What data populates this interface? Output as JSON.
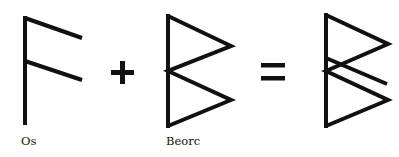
{
  "diagram": {
    "type": "rune-combination",
    "stroke_color": "#111111",
    "background": "#ffffff",
    "operators": {
      "plus": "+",
      "equals": "="
    },
    "runes": [
      {
        "id": "os",
        "label": "Os"
      },
      {
        "id": "beorc",
        "label": "Beorc"
      },
      {
        "id": "combined",
        "label": ""
      }
    ]
  }
}
